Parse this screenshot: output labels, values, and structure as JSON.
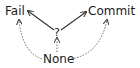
{
  "diagram": {
    "nodes": [
      {
        "id": "fail",
        "label": "Fail"
      },
      {
        "id": "commit",
        "label": "Commit"
      },
      {
        "id": "unknown",
        "label": "?"
      },
      {
        "id": "none",
        "label": "None"
      }
    ],
    "edges": [
      {
        "from": "?",
        "to": "Fail",
        "style": "solid"
      },
      {
        "from": "?",
        "to": "Commit",
        "style": "solid"
      },
      {
        "from": "None",
        "to": "?",
        "style": "dashed"
      },
      {
        "from": "None",
        "to": "Fail",
        "style": "dashed-curved"
      },
      {
        "from": "None",
        "to": "Commit",
        "style": "dashed-curved"
      }
    ],
    "colors": {
      "stroke": "#333333",
      "text": "#1a1a1a",
      "background": "#ffffff"
    }
  }
}
